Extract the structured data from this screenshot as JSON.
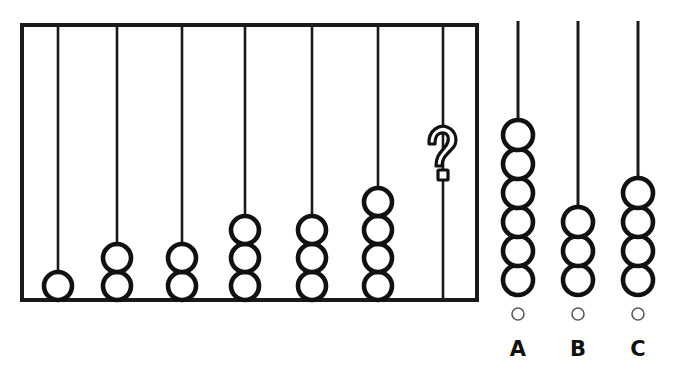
{
  "puzzle": {
    "title": "Abacus bead pattern completion",
    "type": "multiple-choice-visual",
    "line_color": "#1a1a1a",
    "bead_fill": "#ffffff",
    "bead_stroke": "#111111",
    "background": "#ffffff"
  },
  "abacus": {
    "frame": {
      "x": 22,
      "y": 25,
      "width": 455,
      "height": 275
    },
    "bead_radius": 14,
    "bead_spacing": 28,
    "rods": [
      {
        "name": "rod-1",
        "x": 58,
        "bead_count": 1,
        "rod_top": 25
      },
      {
        "name": "rod-2",
        "x": 117,
        "bead_count": 2,
        "rod_top": 25
      },
      {
        "name": "rod-3",
        "x": 182,
        "bead_count": 2,
        "rod_top": 25
      },
      {
        "name": "rod-4",
        "x": 245,
        "bead_count": 3,
        "rod_top": 25
      },
      {
        "name": "rod-5",
        "x": 312,
        "bead_count": 3,
        "rod_top": 25
      },
      {
        "name": "rod-6",
        "x": 378,
        "bead_count": 4,
        "rod_top": 25
      },
      {
        "name": "rod-7",
        "x": 443,
        "bead_count": 0,
        "rod_top": 25,
        "marker": "?"
      }
    ],
    "unknown_rod_marker": "?"
  },
  "options": [
    {
      "id": "A",
      "label": "A",
      "x": 518,
      "bead_count": 6,
      "rod_top": 21,
      "selected": false
    },
    {
      "id": "B",
      "label": "B",
      "x": 578,
      "bead_count": 3,
      "rod_top": 21,
      "selected": false
    },
    {
      "id": "C",
      "label": "C",
      "x": 638,
      "bead_count": 4,
      "rod_top": 21,
      "selected": false
    }
  ],
  "option_layout": {
    "bead_radius": 15,
    "bead_spacing": 29,
    "bead_bottom_y": 295,
    "radio_y": 314,
    "radio_radius": 6,
    "letter_y": 356
  }
}
